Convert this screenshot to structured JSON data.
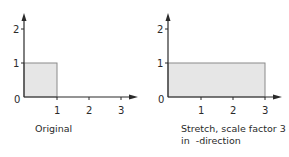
{
  "panels": [
    {
      "caption": "Original",
      "caption_line2": "",
      "rect": {
        "x0": 0,
        "y0": 0,
        "x1": 1,
        "y1": 1
      },
      "x_ticks": [
        "1",
        "2",
        "3"
      ],
      "y_ticks": [
        "1",
        "2"
      ],
      "origin_label": "0"
    },
    {
      "caption": "Stretch, scale factor 3",
      "caption_line2": "in  -direction",
      "rect": {
        "x0": 0,
        "y0": 0,
        "x1": 3,
        "y1": 1
      },
      "x_ticks": [
        "1",
        "2",
        "3"
      ],
      "y_ticks": [
        "1",
        "2"
      ],
      "origin_label": "0"
    }
  ],
  "colors": {
    "axis": "#2a2a2a",
    "fill": "#e6e6e6",
    "rect_stroke": "#8a8a8a"
  }
}
